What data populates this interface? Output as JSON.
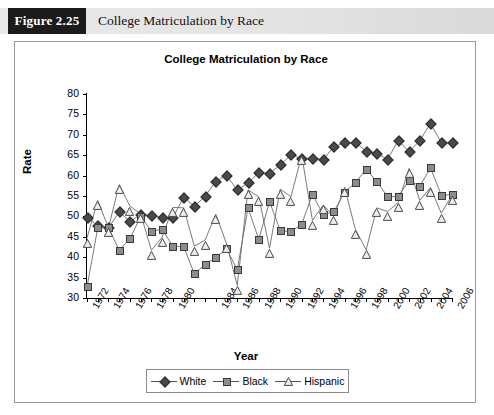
{
  "figure": {
    "number_label": "Figure 2.25",
    "caption": "College Matriculation by Race"
  },
  "chart_data": {
    "type": "line",
    "title": "College Matriculation by Race",
    "xlabel": "Year",
    "ylabel": "Rate",
    "ylim": [
      30,
      80
    ],
    "ytick_step": 5,
    "yticks": [
      30,
      35,
      40,
      45,
      50,
      55,
      60,
      65,
      70,
      75,
      80
    ],
    "xlim": [
      1972,
      2006
    ],
    "x": [
      1972,
      1973,
      1974,
      1975,
      1976,
      1977,
      1978,
      1979,
      1980,
      1981,
      1982,
      1983,
      1984,
      1985,
      1986,
      1987,
      1988,
      1989,
      1990,
      1991,
      1992,
      1993,
      1994,
      1995,
      1996,
      1997,
      1998,
      1999,
      2000,
      2001,
      2002,
      2003,
      2004,
      2005,
      2006
    ],
    "xtick_labels": [
      "1972",
      "1974",
      "1976",
      "1978",
      "1980",
      "1984",
      "1986",
      "1988",
      "1990",
      "1992",
      "1994",
      "1996",
      "1998",
      "2000",
      "2002",
      "2004",
      "2006"
    ],
    "xtick_label_years": [
      1972,
      1974,
      1976,
      1978,
      1980,
      1984,
      1986,
      1988,
      1990,
      1992,
      1994,
      1996,
      1998,
      2000,
      2002,
      2004,
      2006
    ],
    "grid": false,
    "legend_position": "bottom",
    "series": [
      {
        "name": "White",
        "marker": "diamond",
        "color": "#4a4a4a",
        "values": [
          49.7,
          47.8,
          47.2,
          51.1,
          48.8,
          50.4,
          50.3,
          49.8,
          49.7,
          54.7,
          52.5,
          54.9,
          58.6,
          60.0,
          56.5,
          58.2,
          60.7,
          60.6,
          62.6,
          65.1,
          64.1,
          64.3,
          63.9,
          67.1,
          68.0,
          68.1,
          66.0,
          65.4,
          64.0,
          68.7,
          65.8,
          68.6,
          72.8,
          68.1,
          68.1
        ]
      },
      {
        "name": "Black",
        "marker": "square",
        "color": "#8c8c8c",
        "values": [
          32.7,
          47.2,
          47.2,
          41.7,
          44.5,
          50.0,
          46.4,
          46.8,
          42.7,
          42.6,
          35.9,
          38.2,
          39.9,
          42.1,
          36.9,
          52.1,
          44.4,
          53.6,
          46.6,
          46.2,
          48.1,
          55.4,
          50.4,
          51.2,
          55.9,
          58.3,
          61.5,
          58.6,
          54.8,
          54.9,
          58.9,
          57.4,
          61.9,
          55.2,
          55.3
        ]
      },
      {
        "name": "Hispanic",
        "marker": "triangle",
        "color": "#e8e8e8",
        "values": [
          44.7,
          53.9,
          47.2,
          57.8,
          52.5,
          50.6,
          41.7,
          44.9,
          52.2,
          52.1,
          42.7,
          44.2,
          50.5,
          43.3,
          33.1,
          56.5,
          54.8,
          42.2,
          56.7,
          54.8,
          65.0,
          49.0,
          52.8,
          50.1,
          57.1,
          46.8,
          41.8,
          52.1,
          51.2,
          53.4,
          61.8,
          53.9,
          57.1,
          50.8,
          55.1
        ]
      }
    ]
  },
  "legend": {
    "items": [
      {
        "label": "White"
      },
      {
        "label": "Black"
      },
      {
        "label": "Hispanic"
      }
    ]
  }
}
